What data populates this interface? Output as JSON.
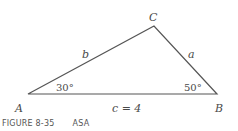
{
  "figure": {
    "caption_number": "FIGURE 8-35",
    "caption_text": "ASA",
    "vertices": {
      "A": {
        "label": "A",
        "x": 28,
        "y": 94
      },
      "B": {
        "label": "B",
        "x": 217,
        "y": 94
      },
      "C": {
        "label": "C",
        "x": 154,
        "y": 26
      }
    },
    "sides": {
      "a": "a",
      "b": "b",
      "c": "c = 4"
    },
    "angles": {
      "A": "30°",
      "B": "50°"
    },
    "colors": {
      "line": "#555555",
      "text": "#4a4a4a"
    }
  }
}
